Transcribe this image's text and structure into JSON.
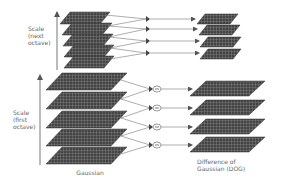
{
  "diagram": {
    "type": "scale-space pyramid / Difference of Gaussian construction",
    "labels": {
      "scale_next_octave": "Scale\n(next\noctave)",
      "scale_first_octave": "Scale\n(first\noctave)",
      "gaussian": "Gaussian",
      "dog": "Difference of\nGaussian (DOG)"
    },
    "octaves": [
      {
        "name": "next octave",
        "gaussian_layers": 5,
        "dog_layers": 4,
        "operator": "subtract"
      },
      {
        "name": "first octave",
        "gaussian_layers": 5,
        "dog_layers": 4,
        "operator": "subtract"
      }
    ],
    "colors": {
      "layer_fill": "#4a4a4a",
      "layer_grid": "#9a9a9a",
      "line": "#777777",
      "text": "#666666"
    }
  }
}
